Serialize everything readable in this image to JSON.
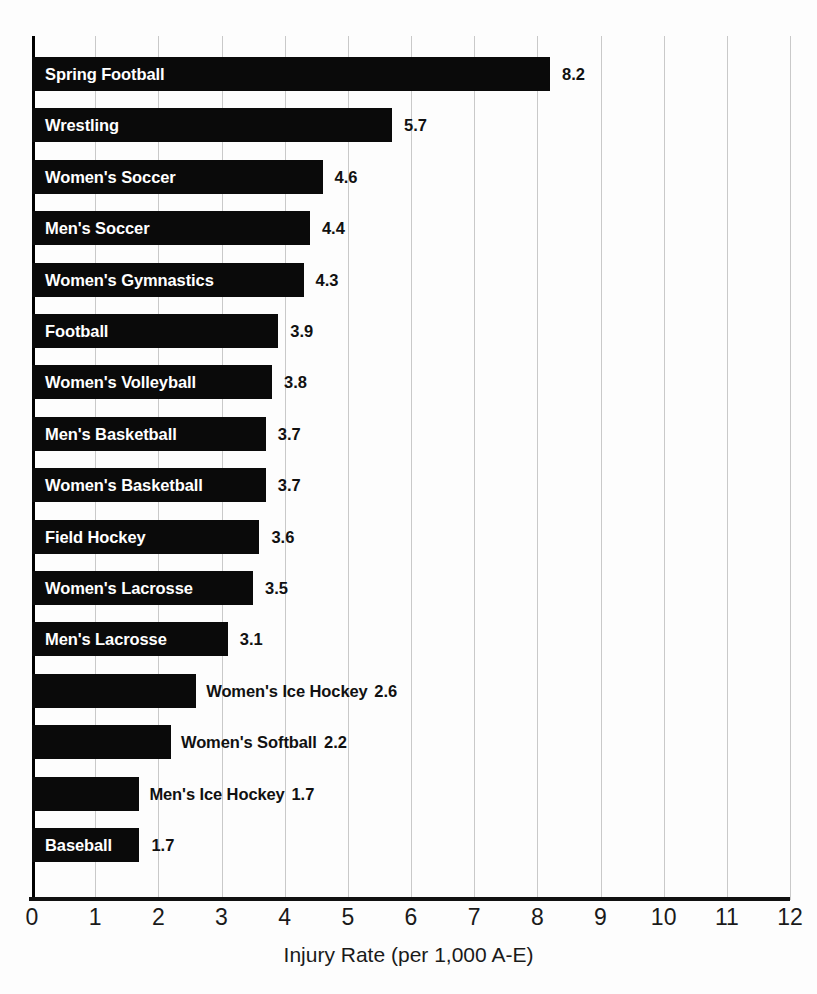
{
  "running_head": "HYMEL et al.",
  "chart_data": {
    "type": "bar",
    "orientation": "horizontal",
    "title": "",
    "subtitle": "",
    "xlabel": "Injury Rate (per 1,000 A-E)",
    "ylabel": "",
    "xlim": [
      0,
      12
    ],
    "xticks": [
      "0",
      "1",
      "2",
      "3",
      "4",
      "5",
      "6",
      "7",
      "8",
      "9",
      "10",
      "11",
      "12"
    ],
    "grid": "vertical",
    "legend": "none",
    "bar_color": "#0a0a0a",
    "inside_label_color": "#ffffff",
    "value_label_color": "#111111",
    "categories": [
      "Spring Football",
      "Wrestling",
      "Women's Soccer",
      "Men's Soccer",
      "Women's Gymnastics",
      "Football",
      "Women's Volleyball",
      "Men's Basketball",
      "Women's Basketball",
      "Field Hockey",
      "Women's Lacrosse",
      "Men's Lacrosse",
      "Women's Ice Hockey",
      "Women's Softball",
      "Men's Ice Hockey",
      "Baseball"
    ],
    "values": [
      8.2,
      5.7,
      4.6,
      4.4,
      4.3,
      3.9,
      3.8,
      3.7,
      3.7,
      3.6,
      3.5,
      3.1,
      2.6,
      2.2,
      1.7,
      1.7
    ],
    "value_labels": [
      "8.2",
      "5.7",
      "4.6",
      "4.4",
      "4.3",
      "3.9",
      "3.8",
      "3.7",
      "3.7",
      "3.6",
      "3.5",
      "3.1",
      "2.6",
      "2.2",
      "1.7",
      "1.7"
    ],
    "label_placement": [
      "inside",
      "inside",
      "inside",
      "inside",
      "inside",
      "inside",
      "inside",
      "inside",
      "inside",
      "inside",
      "inside",
      "inside",
      "outside",
      "outside",
      "outside",
      "inside"
    ]
  }
}
